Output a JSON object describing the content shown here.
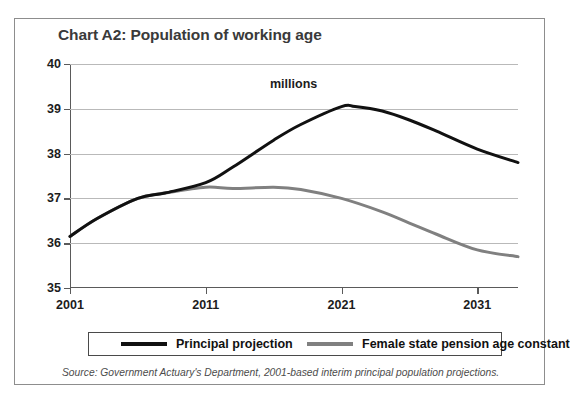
{
  "chart_data": {
    "type": "line",
    "title": "Chart A2: Population of working age",
    "unit_label": "millions",
    "xlabel": "",
    "ylabel": "",
    "xlim": [
      2001,
      2034
    ],
    "ylim": [
      35,
      40
    ],
    "ytick_values": [
      35,
      36,
      37,
      38,
      39,
      40
    ],
    "ytick_labels": [
      "35",
      "36",
      "37",
      "38",
      "39",
      "40"
    ],
    "xtick_values": [
      2001,
      2011,
      2021,
      2031
    ],
    "xtick_labels": [
      "2001",
      "2011",
      "2021",
      "2031"
    ],
    "grid": "horizontal",
    "legend_position": "bottom",
    "series": [
      {
        "name": "Principal projection",
        "color": "#111111",
        "x": [
          2001,
          2003,
          2006,
          2008,
          2011,
          2013,
          2016,
          2018,
          2021,
          2022,
          2024,
          2026,
          2028,
          2031,
          2034
        ],
        "values": [
          36.15,
          36.55,
          37.0,
          37.12,
          37.35,
          37.7,
          38.3,
          38.65,
          39.05,
          39.05,
          38.95,
          38.75,
          38.5,
          38.1,
          37.8
        ]
      },
      {
        "name": "Female state pension age constant",
        "color": "#808080",
        "x": [
          2001,
          2003,
          2006,
          2008,
          2011,
          2013,
          2016,
          2018,
          2021,
          2024,
          2026,
          2028,
          2031,
          2034
        ],
        "values": [
          36.15,
          36.55,
          37.0,
          37.12,
          37.25,
          37.22,
          37.25,
          37.2,
          37.0,
          36.7,
          36.45,
          36.2,
          35.85,
          35.7
        ]
      }
    ],
    "source": "Source: Government Actuary's Department, 2001-based interim principal population projections."
  },
  "legend": {
    "entries": [
      {
        "label": "Principal projection"
      },
      {
        "label": "Female state pension age constant"
      }
    ]
  }
}
